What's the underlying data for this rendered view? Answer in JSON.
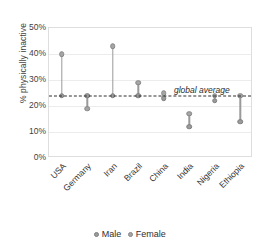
{
  "chart_data": {
    "type": "scatter",
    "title": "",
    "xlabel": "",
    "ylabel": "% physically inactive",
    "ylim": [
      0,
      50
    ],
    "ytick_labels": [
      "0%",
      "10%",
      "20%",
      "30%",
      "40%",
      "50%"
    ],
    "ytick_values": [
      0,
      10,
      20,
      30,
      40,
      50
    ],
    "grid": true,
    "legend_position": "bottom",
    "categories": [
      "USA",
      "Germany",
      "Iran",
      "Brazil",
      "China",
      "India",
      "Nigeria",
      "Ethiopia"
    ],
    "series": [
      {
        "name": "Male",
        "values": [
          24,
          24,
          24,
          24,
          23,
          12,
          22,
          14
        ]
      },
      {
        "name": "Female",
        "values": [
          40,
          19,
          43,
          29,
          25,
          17,
          24,
          24
        ]
      }
    ],
    "annotations": [
      {
        "name": "global-average",
        "label": "global average",
        "value": 24,
        "style": "dashed-horizontal-line"
      }
    ]
  },
  "legend": {
    "items": [
      {
        "label": "Male"
      },
      {
        "label": "Female"
      }
    ]
  },
  "colors": {
    "male_marker": "#9b9b9b",
    "female_marker": "#a6a6a6",
    "connector": "#9a9a9a",
    "average_line": "#2e2e2e",
    "gridline": "#ececec",
    "frame": "#dedede"
  }
}
